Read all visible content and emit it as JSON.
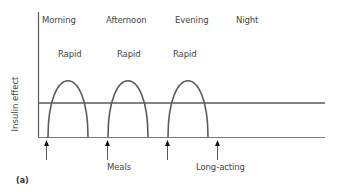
{
  "figure": {
    "panel_label": "(a)",
    "y_axis_label": "Insulin effect",
    "periods": [
      "Morning",
      "Afternoon",
      "Evening",
      "Night"
    ],
    "rapid_labels": [
      "Rapid",
      "Rapid",
      "Rapid"
    ],
    "annotations": {
      "meals": "Meals",
      "long_acting": "Long-acting"
    },
    "colors": {
      "line": "#5a5a5a",
      "text": "#444444",
      "background": "#ffffff"
    },
    "curves": {
      "rapid": [
        {
          "label": "Rapid",
          "period": "Morning",
          "start_x": 48,
          "end_x": 88,
          "peak_y": 73
        },
        {
          "label": "Rapid",
          "period": "Afternoon",
          "start_x": 108,
          "end_x": 148,
          "peak_y": 73
        },
        {
          "label": "Rapid",
          "period": "Evening",
          "start_x": 168,
          "end_x": 208,
          "peak_y": 73
        }
      ],
      "long_acting": {
        "label": "Long-acting",
        "level_y": 103,
        "flat": true
      }
    },
    "arrows": [
      {
        "x": 46,
        "target": "Meals (morning)"
      },
      {
        "x": 107,
        "target": "Meals (afternoon)"
      },
      {
        "x": 167,
        "target": "Meals (evening)"
      },
      {
        "x": 217,
        "target": "Long-acting"
      }
    ]
  }
}
